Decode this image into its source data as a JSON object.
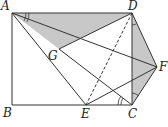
{
  "diagram": {
    "type": "geometry",
    "points": {
      "A": {
        "label": "A",
        "x": 12,
        "y": 13
      },
      "B": {
        "label": "B",
        "x": 12,
        "y": 105
      },
      "C": {
        "label": "C",
        "x": 132,
        "y": 105
      },
      "D": {
        "label": "D",
        "x": 132,
        "y": 13
      },
      "E": {
        "label": "E",
        "x": 86,
        "y": 105
      },
      "F": {
        "label": "F",
        "x": 157,
        "y": 67
      },
      "G": {
        "label": "G",
        "x": 59,
        "y": 49
      }
    },
    "segments": [
      [
        "A",
        "B"
      ],
      [
        "B",
        "C"
      ],
      [
        "C",
        "D"
      ],
      [
        "D",
        "A"
      ],
      [
        "A",
        "E"
      ],
      [
        "A",
        "F"
      ],
      [
        "D",
        "G"
      ],
      [
        "D",
        "F"
      ],
      [
        "F",
        "C"
      ],
      [
        "E",
        "F"
      ],
      [
        "G",
        "C"
      ]
    ],
    "dashed_segments": [
      [
        "D",
        "E"
      ]
    ],
    "shaded_regions": [
      [
        "A",
        "D",
        "G"
      ],
      [
        "D",
        "F",
        "C"
      ]
    ],
    "shade_color": "#c8c8c8",
    "line_color": "#333333"
  }
}
